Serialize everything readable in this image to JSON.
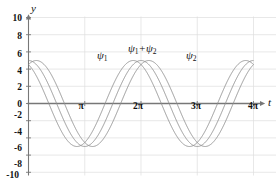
{
  "chart_data": {
    "type": "line",
    "title": "",
    "subtitle": "",
    "xlabel": "t",
    "ylabel": "y",
    "xlim": [
      0,
      12.566370614359172
    ],
    "ylim": [
      -10,
      10
    ],
    "grid": true,
    "legend_position": "inline-annotations",
    "y_ticks": [
      10,
      8,
      6,
      4,
      2,
      0,
      -2,
      -4,
      -6,
      -8,
      -10
    ],
    "y_tick_labels": [
      "10",
      "8",
      "6",
      "4",
      "2",
      "0",
      "-2",
      "-4",
      "-6",
      "-8",
      "-10"
    ],
    "x_ticks": [
      3.141592653589793,
      6.283185307179586,
      9.42477796076938,
      12.566370614359172
    ],
    "x_tick_labels": [
      "π",
      "2π",
      "3π",
      "4π"
    ],
    "annotations": [
      {
        "text": "ψ",
        "sub": "1",
        "x": 4.0,
        "y": 6.6
      },
      {
        "text": "ψ",
        "sub": "1",
        "text2": "+ψ",
        "sub2": "2",
        "x": 5.55,
        "y": 7.4
      },
      {
        "text": "ψ",
        "sub": "2",
        "x": 8.1,
        "y": 6.6
      }
    ],
    "series": [
      {
        "name": "ψ₁",
        "color": "#8c8c8c",
        "form": "cosine",
        "amplitude": 5,
        "period": 6.283185307179586,
        "phase_deg": 25,
        "offset": 0,
        "linewidth": 0.9
      },
      {
        "name": "ψ₂",
        "color": "#8c8c8c",
        "form": "cosine",
        "amplitude": 5,
        "period": 6.283185307179586,
        "phase_deg": -25,
        "offset": 0,
        "linewidth": 0.9
      },
      {
        "name": "ψ₁+ψ₂",
        "color": "#8c8c8c",
        "form": "cosine",
        "amplitude": 5,
        "period": 6.283185307179586,
        "phase_deg": 0,
        "offset": 0,
        "linewidth": 0.9
      }
    ]
  },
  "style": {
    "grid_color": "#dedede",
    "axis_color": "#777777",
    "curve_color": "#8c8c8c",
    "text_color": "#111111",
    "background": "#ffffff"
  },
  "labels": {
    "y_axis": "y",
    "x_axis": "t",
    "psi1": "ψ",
    "psi1_sub": "1",
    "psi_sum_a": "ψ",
    "psi_sum_a_sub": "1",
    "psi_sum_mid": "+ψ",
    "psi_sum_b_sub": "2",
    "psi2": "ψ",
    "psi2_sub": "2",
    "y_10": "10",
    "y_8": "8",
    "y_6": "6",
    "y_4": "4",
    "y_2": "2",
    "y_0": "0",
    "y_m2": "-2",
    "y_m4": "-4",
    "y_m6": "-6",
    "y_m8": "-8",
    "y_m10": "-10",
    "x_pi": "π",
    "x_2pi": "2π",
    "x_3pi": "3π",
    "x_4pi": "4π"
  }
}
